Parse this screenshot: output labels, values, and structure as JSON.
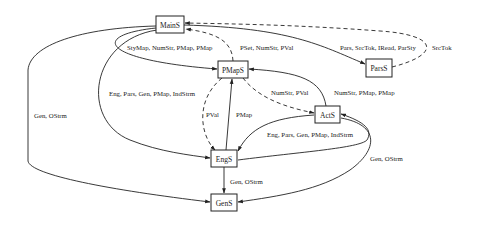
{
  "diagram": {
    "nodes": [
      {
        "id": "MainS",
        "label": "MainS"
      },
      {
        "id": "PMapS",
        "label": "PMapS"
      },
      {
        "id": "ParsS",
        "label": "ParsS"
      },
      {
        "id": "ActS",
        "label": "ActS"
      },
      {
        "id": "EngS",
        "label": "EngS"
      },
      {
        "id": "GenS",
        "label": "GenS"
      }
    ],
    "edges": [
      {
        "from": "MainS",
        "to": "PMapS",
        "style": "solid",
        "label": "StyMap, NumStr, PMap, PMap"
      },
      {
        "from": "PMapS",
        "to": "MainS",
        "style": "dashed",
        "label": "PSet, NumStr, PVal"
      },
      {
        "from": "MainS",
        "to": "ParsS",
        "style": "solid",
        "label": "Pars, SrcTok, IRead, ParSty"
      },
      {
        "from": "ParsS",
        "to": "MainS",
        "style": "dashed",
        "label": "SrcTok"
      },
      {
        "from": "MainS",
        "to": "EngS",
        "style": "solid",
        "label": "Eng, Pars, Gen, PMap, IndStrm"
      },
      {
        "from": "MainS",
        "to": "GenS",
        "style": "solid",
        "label": "Gen, OStrm"
      },
      {
        "from": "PMapS",
        "to": "EngS",
        "style": "dashed",
        "label": "PVal"
      },
      {
        "from": "EngS",
        "to": "PMapS",
        "style": "solid",
        "label": "PMap"
      },
      {
        "from": "PMapS",
        "to": "ActS",
        "style": "dashed",
        "label": "NumStr, PVal"
      },
      {
        "from": "ActS",
        "to": "PMapS",
        "style": "solid",
        "label": "NumStr, PMap, PMap"
      },
      {
        "from": "ActS",
        "to": "EngS",
        "style": "solid",
        "label": "Eng, Pars, Gen, PMap, IndStrm"
      },
      {
        "from": "EngS",
        "to": "ActS",
        "style": "solid",
        "label": ""
      },
      {
        "from": "ActS",
        "to": "GenS",
        "style": "solid",
        "label": "Gen, OStrm"
      },
      {
        "from": "EngS",
        "to": "GenS",
        "style": "solid",
        "label": "Gen, OStrm"
      }
    ]
  }
}
